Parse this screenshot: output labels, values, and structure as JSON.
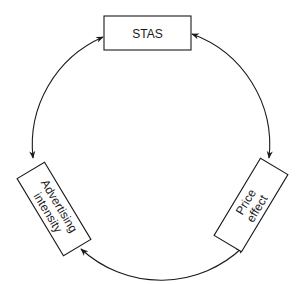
{
  "diagram": {
    "type": "cycle",
    "nodes": [
      {
        "id": "stas",
        "lines": [
          "STAS"
        ]
      },
      {
        "id": "price-effect",
        "lines": [
          "Price",
          "effect"
        ]
      },
      {
        "id": "advertising-intensity",
        "lines": [
          "Advertising",
          "intensity"
        ]
      }
    ],
    "edges": [
      {
        "from": "advertising-intensity",
        "to": "stas",
        "bidirectional": true
      },
      {
        "from": "stas",
        "to": "price-effect",
        "bidirectional": true
      },
      {
        "from": "price-effect",
        "to": "advertising-intensity",
        "bidirectional": true
      }
    ],
    "colors": {
      "stroke": "#1a1a1a",
      "background": "#ffffff"
    }
  }
}
